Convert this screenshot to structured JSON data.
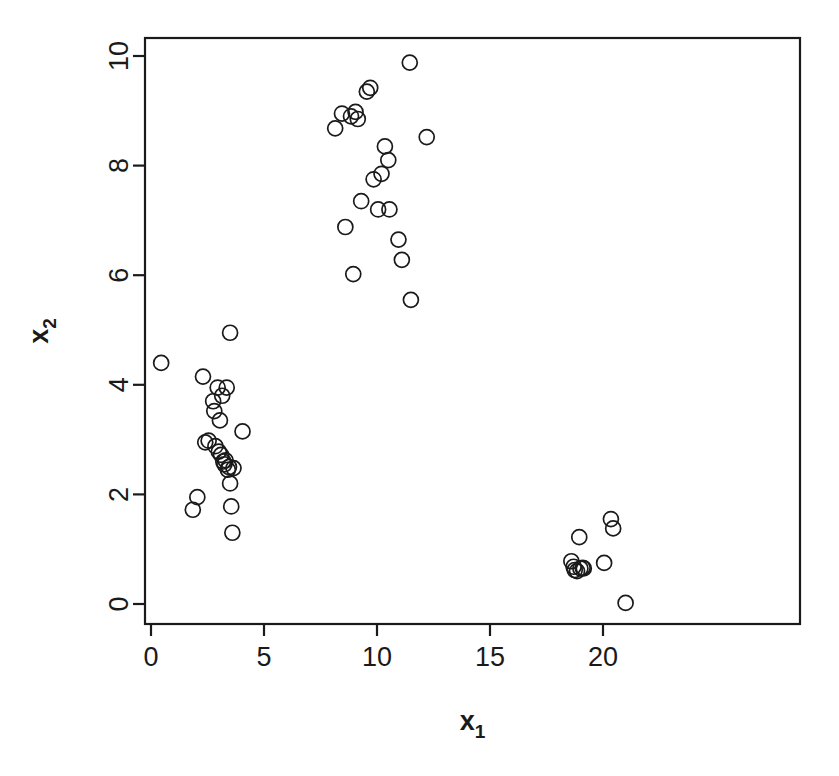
{
  "chart_data": {
    "type": "scatter",
    "title": "",
    "subtitle": "",
    "xlabel": "x",
    "xlabel_sub": "1",
    "ylabel": "x",
    "ylabel_sub": "2",
    "xlim": [
      -0.55,
      21.7
    ],
    "ylim": [
      -0.5,
      10.35
    ],
    "xticks": [
      0,
      5,
      10,
      15,
      20
    ],
    "xticklabels": [
      "0",
      "5",
      "10",
      "15",
      "20"
    ],
    "yticks": [
      0,
      2,
      4,
      6,
      8,
      10
    ],
    "yticklabels": [
      "0",
      "2",
      "4",
      "6",
      "8",
      "10"
    ],
    "grid": false,
    "legend": null,
    "box": true,
    "marker": {
      "shape": "open-circle",
      "radius_px": 7.5,
      "stroke": "#1a1a1a",
      "stroke_width": 1.7,
      "fill": "none"
    },
    "series": [
      {
        "name": "points",
        "points": [
          [
            0.45,
            4.4
          ],
          [
            1.85,
            1.72
          ],
          [
            2.05,
            1.95
          ],
          [
            2.3,
            4.15
          ],
          [
            2.4,
            2.95
          ],
          [
            2.55,
            2.98
          ],
          [
            2.75,
            3.7
          ],
          [
            2.8,
            3.52
          ],
          [
            2.85,
            2.88
          ],
          [
            2.95,
            3.95
          ],
          [
            3.0,
            2.78
          ],
          [
            3.05,
            3.35
          ],
          [
            3.1,
            2.72
          ],
          [
            3.15,
            3.8
          ],
          [
            3.2,
            2.6
          ],
          [
            3.25,
            2.55
          ],
          [
            3.3,
            2.62
          ],
          [
            3.35,
            3.95
          ],
          [
            3.4,
            2.45
          ],
          [
            3.45,
            2.5
          ],
          [
            3.5,
            4.95
          ],
          [
            3.5,
            2.2
          ],
          [
            3.55,
            1.78
          ],
          [
            3.6,
            1.3
          ],
          [
            3.65,
            2.48
          ],
          [
            4.05,
            3.15
          ],
          [
            8.15,
            8.68
          ],
          [
            8.45,
            8.95
          ],
          [
            8.6,
            6.88
          ],
          [
            8.85,
            8.9
          ],
          [
            8.95,
            6.02
          ],
          [
            9.05,
            8.98
          ],
          [
            9.15,
            8.85
          ],
          [
            9.3,
            7.35
          ],
          [
            9.55,
            9.35
          ],
          [
            9.7,
            9.42
          ],
          [
            9.85,
            7.75
          ],
          [
            10.05,
            7.2
          ],
          [
            10.2,
            7.85
          ],
          [
            10.35,
            8.35
          ],
          [
            10.5,
            8.1
          ],
          [
            10.55,
            7.2
          ],
          [
            10.95,
            6.65
          ],
          [
            11.1,
            6.28
          ],
          [
            11.45,
            9.88
          ],
          [
            11.5,
            5.55
          ],
          [
            12.2,
            8.52
          ],
          [
            18.6,
            0.78
          ],
          [
            18.7,
            0.68
          ],
          [
            18.75,
            0.62
          ],
          [
            18.85,
            0.6
          ],
          [
            18.95,
            1.22
          ],
          [
            19.0,
            0.65
          ],
          [
            19.1,
            0.66
          ],
          [
            19.15,
            0.65
          ],
          [
            20.05,
            0.75
          ],
          [
            20.35,
            1.55
          ],
          [
            20.45,
            1.38
          ],
          [
            21.0,
            0.02
          ]
        ]
      }
    ],
    "n_points": 59
  },
  "plot_geometry": {
    "box_left_px": 145,
    "box_right_px": 800,
    "box_top_px": 38,
    "box_bottom_px": 624,
    "x0_px": 151,
    "x_per_unit_px": 22.6,
    "y0_px": 604,
    "y_per_unit_px": 54.8,
    "tick_len_px": 12
  },
  "colors": {
    "background": "#ffffff",
    "foreground": "#1a1a1a",
    "marker_stroke": "#1a1a1a"
  }
}
